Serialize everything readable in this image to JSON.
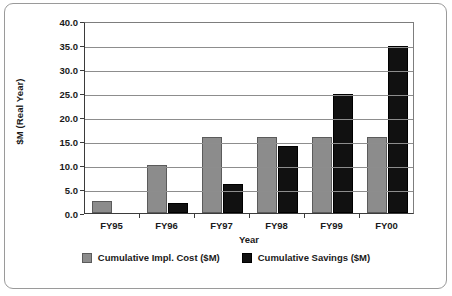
{
  "chart_data": {
    "type": "bar",
    "title": "",
    "subtitle": "",
    "xlabel": "Year",
    "ylabel": "$M (Real Year)",
    "categories": [
      "FY95",
      "FY96",
      "FY97",
      "FY98",
      "FY99",
      "FY00"
    ],
    "series": [
      {
        "name": "Cumulative Impl. Cost ($M)",
        "color": "#8c8c8c",
        "values": [
          2.5,
          10.0,
          15.8,
          15.8,
          15.8,
          15.8
        ]
      },
      {
        "name": "Cumulative Savings ($M)",
        "color": "#111111",
        "values": [
          0.0,
          2.0,
          6.0,
          13.9,
          24.7,
          34.8
        ]
      }
    ],
    "ylim": [
      0.0,
      40.0
    ],
    "ytick_step": 5.0,
    "ytick_labels": [
      "0.0",
      "5.0",
      "10.0",
      "15.0",
      "20.0",
      "25.0",
      "30.0",
      "35.0",
      "40.0"
    ],
    "grid": true,
    "grid_axis": "y",
    "legend_position": "bottom"
  },
  "axes": {
    "y_title": "$M (Real Year)",
    "x_title": "Year"
  },
  "legend": {
    "items": [
      {
        "label": "Cumulative Impl. Cost ($M)",
        "swatch": "cost"
      },
      {
        "label": "Cumulative Savings ($M)",
        "swatch": "savings"
      }
    ]
  }
}
